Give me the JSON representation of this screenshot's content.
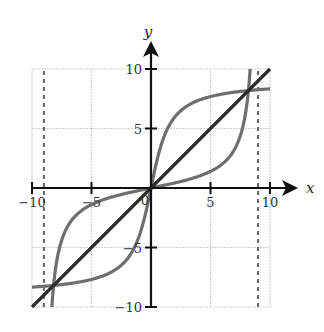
{
  "chart_data": {
    "type": "line",
    "title": "",
    "xlabel": "x",
    "ylabel": "y",
    "xlim": [
      -10,
      10
    ],
    "ylim": [
      -10,
      10
    ],
    "grid": true,
    "x_ticks": [
      -10,
      -5,
      0,
      5,
      10
    ],
    "y_ticks": [
      -10,
      -5,
      5,
      10
    ],
    "x_tick_labels": [
      "−10",
      "−5",
      "0",
      "5",
      "10"
    ],
    "y_tick_labels": [
      "−10",
      "−5",
      "5",
      "10"
    ],
    "origin_label": "0",
    "asymptotes": [
      {
        "type": "vertical",
        "x": -9,
        "style": "dashed"
      },
      {
        "type": "vertical",
        "x": 9,
        "style": "dashed"
      }
    ],
    "series": [
      {
        "name": "y = x",
        "description": "line of symmetry",
        "color": "#2b2b2b",
        "x": [
          -10,
          -5,
          0,
          5,
          10
        ],
        "y": [
          -10,
          -5,
          0,
          5,
          10
        ]
      },
      {
        "name": "f(x)",
        "description": "tangent-like curve with vertical asymptotes near x = ±9",
        "color": "#6e6e6e",
        "x": [
          -8.4,
          -8,
          -7,
          -6,
          -4,
          -2,
          0,
          2,
          4,
          6,
          7,
          8,
          8.4
        ],
        "y": [
          -10.0,
          -6.6,
          -3.2,
          -2.0,
          -0.98,
          -0.41,
          0,
          0.41,
          0.98,
          2.0,
          3.2,
          6.6,
          10.0
        ]
      },
      {
        "name": "f⁻¹(x)",
        "description": "inverse (arctangent-like) curve, horizontal asymptotes near y = ±9",
        "color": "#6e6e6e",
        "x": [
          -10,
          -6.6,
          -3.2,
          -2.0,
          -0.98,
          -0.41,
          0,
          0.41,
          0.98,
          2.0,
          3.2,
          6.6,
          10
        ],
        "y": [
          -8.4,
          -8,
          -7,
          -6,
          -4,
          -2,
          0,
          2,
          4,
          6,
          7,
          8,
          8.4
        ]
      }
    ],
    "intersections": [
      {
        "x": -8.2,
        "y": -8.2
      },
      {
        "x": 0,
        "y": 0
      },
      {
        "x": 8.2,
        "y": 8.2
      }
    ],
    "layout": {
      "origin_px": [
        151,
        188
      ],
      "px_per_unit": 11.9,
      "grid_color": "#cfcfcf",
      "axis_color": "#111111"
    }
  }
}
